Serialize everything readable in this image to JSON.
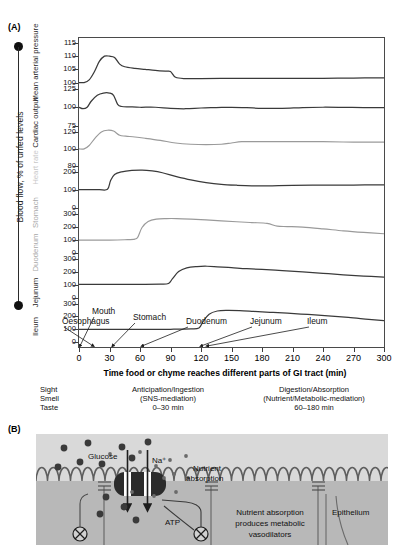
{
  "panels": {
    "a_tag": "(A)",
    "b_tag": "(B)"
  },
  "panelA": {
    "vertical_axis_title": "Blood flow, % of unfed levels",
    "xaxis_title": "Time food or chyme reaches different parts of GI tract (min)",
    "row_labels": [
      "Mean arterial pressure",
      "Cardiac output",
      "Heart rate",
      "Stomach",
      "Duodenum",
      "Jejunum",
      "Ileum"
    ],
    "organ_annotations": [
      "Mouth",
      "Oesophagus",
      "Stomach",
      "Duodenum",
      "Jejunum",
      "Ileum"
    ],
    "phase_table": {
      "column1": [
        "Sight",
        "Smell",
        "Taste"
      ],
      "column2": [
        "Anticipation/Ingestion",
        "(SNS-mediation)",
        "0–30 min"
      ],
      "column3": [
        "Digestion/Absorption",
        "(Nutrient/Metabolic-mediation)",
        "60–180 min"
      ]
    },
    "colors": {
      "trace_dark": "#3a3a3a",
      "trace_light": "#9a9a9a",
      "axis": "#4a4a4a",
      "faint_label": "#c9c9c9"
    }
  },
  "chart_data": {
    "type": "line",
    "title": "Blood flow, % of unfed levels",
    "xlabel": "Time food or chyme reaches different parts of GI tract (min)",
    "ylabel": "Blood flow, % of unfed levels",
    "xlim": [
      0,
      300
    ],
    "xticks": [
      0,
      30,
      60,
      90,
      120,
      150,
      180,
      210,
      240,
      270,
      300
    ],
    "grid": false,
    "legend": "none",
    "shared_x_stacked_rows": true,
    "rows": [
      {
        "name": "Mean arterial pressure",
        "ylim": [
          100,
          115
        ],
        "yticks": [
          100,
          105,
          110,
          115
        ],
        "shade": "dark",
        "x": [
          0,
          5,
          10,
          15,
          20,
          25,
          30,
          35,
          40,
          45,
          55,
          65,
          75,
          85,
          90,
          95,
          105,
          120,
          150,
          180,
          210,
          240,
          270,
          300
        ],
        "values": [
          100,
          100,
          101,
          104,
          108,
          110,
          110,
          109.5,
          107,
          106,
          105.4,
          105,
          104.6,
          104.3,
          104.2,
          102,
          101.5,
          101.5,
          101.6,
          101.6,
          101.6,
          101.6,
          101.7,
          101.8
        ]
      },
      {
        "name": "Cardiac output",
        "ylim": [
          75,
          125
        ],
        "yticks": [
          75,
          100,
          125
        ],
        "shade": "dark",
        "x": [
          0,
          4,
          8,
          12,
          18,
          24,
          30,
          34,
          38,
          42,
          50,
          60,
          75,
          90,
          105,
          120,
          135,
          150,
          165,
          180,
          200,
          220,
          240,
          260,
          280,
          300
        ],
        "values": [
          100,
          98,
          100,
          108,
          116,
          119,
          119,
          116,
          104,
          101,
          100.5,
          100,
          100,
          98.5,
          98,
          99,
          99.5,
          100,
          99.5,
          98.5,
          98.5,
          99.5,
          100,
          99.8,
          99.5,
          99.5
        ]
      },
      {
        "name": "Heart rate",
        "ylim": [
          80,
          120
        ],
        "yticks": [
          80,
          100,
          120
        ],
        "shade": "light",
        "x": [
          0,
          5,
          10,
          16,
          22,
          28,
          34,
          40,
          46,
          55,
          65,
          80,
          95,
          110,
          125,
          140,
          150,
          160,
          175,
          195,
          215,
          240,
          270,
          300
        ],
        "values": [
          100,
          100,
          104,
          113,
          120,
          122,
          121,
          116,
          115,
          114,
          112.5,
          110,
          107,
          105.5,
          105,
          105.5,
          107,
          108.5,
          108.5,
          108.5,
          108.5,
          108.5,
          108,
          108
        ]
      },
      {
        "name": "Stomach",
        "ylim": [
          0,
          200
        ],
        "yticks": [
          0,
          100,
          200
        ],
        "shade": "dark",
        "x": [
          0,
          10,
          20,
          28,
          31,
          35,
          42,
          52,
          62,
          72,
          82,
          95,
          110,
          125,
          140,
          155,
          170,
          190,
          210,
          240,
          270,
          300
        ],
        "values": [
          100,
          100,
          100,
          102,
          150,
          185,
          200,
          208,
          210,
          205,
          195,
          175,
          155,
          140,
          130,
          125,
          122,
          122,
          124,
          126,
          126,
          127
        ]
      },
      {
        "name": "Duodenum",
        "ylim": [
          0,
          300
        ],
        "yticks": [
          0,
          100,
          200,
          300
        ],
        "shade": "light",
        "x": [
          0,
          15,
          30,
          45,
          55,
          58,
          62,
          68,
          76,
          86,
          96,
          110,
          125,
          140,
          155,
          170,
          185,
          195,
          205,
          220,
          240,
          260,
          280,
          300
        ],
        "values": [
          100,
          100,
          100,
          103,
          108,
          125,
          195,
          240,
          258,
          262,
          262,
          258,
          252,
          245,
          238,
          232,
          226,
          205,
          202,
          198,
          185,
          170,
          158,
          148
        ]
      },
      {
        "name": "Jejunum",
        "ylim": [
          0,
          300
        ],
        "yticks": [
          0,
          100,
          200,
          300
        ],
        "shade": "dark",
        "x": [
          0,
          20,
          40,
          60,
          80,
          88,
          92,
          98,
          106,
          116,
          126,
          136,
          150,
          165,
          180,
          200,
          220,
          240,
          260,
          280,
          300
        ],
        "values": [
          105,
          105,
          105,
          105,
          106,
          112,
          150,
          205,
          235,
          245,
          247,
          243,
          236,
          228,
          222,
          213,
          203,
          192,
          180,
          170,
          162
        ]
      },
      {
        "name": "Ileum",
        "ylim": [
          0,
          300
        ],
        "yticks": [
          0,
          100,
          200,
          300
        ],
        "shade": "dark",
        "x": [
          0,
          30,
          60,
          90,
          110,
          118,
          122,
          128,
          136,
          146,
          158,
          172,
          188,
          205,
          225,
          245,
          265,
          285,
          300
        ],
        "values": [
          100,
          100,
          100,
          100,
          102,
          110,
          160,
          218,
          243,
          248,
          246,
          240,
          233,
          226,
          216,
          205,
          193,
          178,
          168
        ]
      }
    ],
    "annotations": [
      {
        "label": "Mouth",
        "x": 0
      },
      {
        "label": "Oesophagus",
        "x": 0
      },
      {
        "label": "Stomach",
        "x": 30
      },
      {
        "label": "Duodenum",
        "x": 60
      },
      {
        "label": "Jejunum",
        "x": 120
      },
      {
        "label": "Ileum",
        "x": 120
      }
    ]
  },
  "panelB": {
    "labels": {
      "glucose": "Glucose",
      "sodium": "Na⁺",
      "nutrient_absorption": "Nutrient\nabsorption",
      "nutrient_absorption_l1": "Nutrient",
      "nutrient_absorption_l2": "absorption",
      "atp": "ATP",
      "metabolic_l1": "Nutrient absorption",
      "metabolic_l2": "produces metabolic",
      "metabolic_l3": "vasodilators",
      "epithelium": "Epithelium"
    },
    "colors": {
      "lumen_bg": "#d8d8d8",
      "cell_bg": "#b7b7b7",
      "membrane": "#5a5a5a",
      "transporter": "#2e2e2e",
      "particle": "#3c3c3c"
    }
  }
}
